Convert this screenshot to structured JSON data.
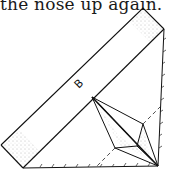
{
  "caption": "the nose up again.",
  "diagram": {
    "strip_label": "B",
    "colors": {
      "line": "#111111",
      "shade": "#777777",
      "paper": "#ffffff"
    }
  }
}
